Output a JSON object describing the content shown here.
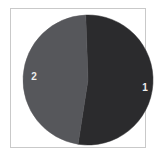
{
  "figure": {
    "background_color": "#ffffff",
    "frame_color": "#c9c9c9",
    "label_color": "#ededed"
  },
  "chart_data": {
    "type": "pie",
    "title": "",
    "subtitle": "",
    "xlabel": "",
    "ylabel": "",
    "grid": false,
    "legend": "none",
    "labels_position": "inside-slice",
    "categories": [
      "1",
      "2"
    ],
    "values": [
      53,
      47
    ],
    "percentages": [
      53,
      47
    ],
    "colors": [
      "#2b2b2d",
      "#56575b"
    ],
    "start_angle_deg": -2,
    "direction": "clockwise",
    "center": {
      "x": 88,
      "y": 80
    },
    "radius": 65,
    "slices": [
      {
        "label": "1",
        "value": 53,
        "percent": 53,
        "color": "#2b2b2d",
        "label_x": 145,
        "label_y": 88
      },
      {
        "label": "2",
        "value": 47,
        "percent": 47,
        "color": "#56575b",
        "label_x": 34,
        "label_y": 77
      }
    ]
  }
}
